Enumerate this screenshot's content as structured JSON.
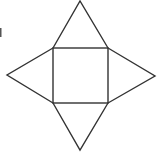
{
  "diagram": {
    "title": "",
    "shape": "square-pyramid-net",
    "faces": [
      {
        "name": "base",
        "type": "square"
      },
      {
        "name": "top",
        "type": "triangle"
      },
      {
        "name": "left",
        "type": "triangle"
      },
      {
        "name": "right",
        "type": "triangle"
      },
      {
        "name": "bottom",
        "type": "triangle"
      }
    ],
    "line_color": "#333333",
    "background": "#ffffff"
  }
}
